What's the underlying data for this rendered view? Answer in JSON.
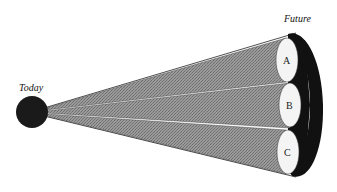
{
  "labels": {
    "origin": "Today",
    "destination": "Future"
  },
  "cones": [
    {
      "id": "A",
      "label": "A"
    },
    {
      "id": "B",
      "label": "B"
    },
    {
      "id": "C",
      "label": "C"
    }
  ],
  "colors": {
    "background": "#ffffff",
    "origin_circle": "#1a1a1a",
    "cone_fill": "#8a8a8a",
    "cone_end": "#f4f4f4",
    "backdrop": "#111111",
    "outline": "#222222"
  }
}
